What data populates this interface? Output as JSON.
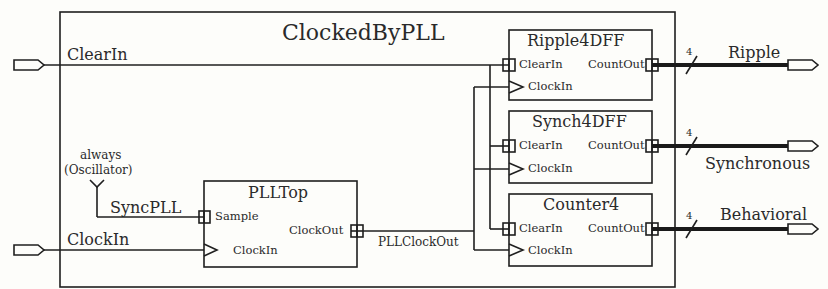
{
  "diagram": {
    "title": "ClockedByPLL",
    "inputs": [
      {
        "name": "ClearIn"
      },
      {
        "name": "ClockIn"
      }
    ],
    "outputs": [
      {
        "name": "Ripple",
        "width": "4"
      },
      {
        "name": "Synchronous",
        "width": "4"
      },
      {
        "name": "Behavioral",
        "width": "4"
      }
    ],
    "constant_source": {
      "line1": "always",
      "line2": "(Oscillator)",
      "net": "SyncPLL"
    },
    "blocks": [
      {
        "name": "PLLTop",
        "ports": {
          "sample": "Sample",
          "clock_in": "ClockIn",
          "clock_out": "ClockOut"
        }
      },
      {
        "name": "Ripple4DFF",
        "ports": {
          "clear_in": "ClearIn",
          "clock_in": "ClockIn",
          "count_out": "CountOut"
        }
      },
      {
        "name": "Synch4DFF",
        "ports": {
          "clear_in": "ClearIn",
          "clock_in": "ClockIn",
          "count_out": "CountOut"
        }
      },
      {
        "name": "Counter4",
        "ports": {
          "clear_in": "ClearIn",
          "clock_in": "ClockIn",
          "count_out": "CountOut"
        }
      }
    ],
    "nets": {
      "pll_clock_out": "PLLClockOut"
    },
    "colors": {
      "line": "#1f1f1f",
      "background": "#fdfdfa"
    }
  }
}
